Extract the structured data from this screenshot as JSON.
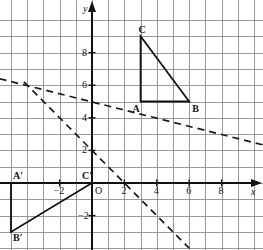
{
  "figure": {
    "kind": "coordinate-plane-geometry-diagram",
    "background_color": "#ffffff",
    "grid_color": "#6b6b6b",
    "axis_color": "#111111",
    "shape_color": "#101010",
    "dashed_color": "#1a1a1a"
  },
  "axes": {
    "x_axis_label": "x",
    "y_axis_label": "y",
    "origin_label": "O",
    "x_ticks": [
      {
        "value": -2,
        "label": "−2"
      },
      {
        "value": 2,
        "label": "2"
      },
      {
        "value": 4,
        "label": "4"
      },
      {
        "value": 6,
        "label": "6"
      },
      {
        "value": 8,
        "label": "8"
      }
    ],
    "y_ticks": [
      {
        "value": -2,
        "label": "−2"
      },
      {
        "value": 2,
        "label": "2"
      },
      {
        "value": 4,
        "label": "4"
      },
      {
        "value": 6,
        "label": "6"
      },
      {
        "value": 8,
        "label": "8"
      }
    ],
    "x_range": [
      -5.7,
      10.7
    ],
    "y_range": [
      -4.0,
      10.4
    ],
    "grid_step": 1
  },
  "chart_data": {
    "type": "scatter",
    "title": "",
    "xlabel": "x",
    "ylabel": "y",
    "xlim": [
      -5.7,
      10.7
    ],
    "ylim": [
      -4.0,
      10.4
    ],
    "grid": true,
    "shapes": [
      {
        "name": "triangle-ABC",
        "style": "solid",
        "vertices": [
          {
            "label": "A",
            "x": 3,
            "y": 5,
            "label_pos": "below-left"
          },
          {
            "label": "B",
            "x": 6,
            "y": 5,
            "label_pos": "below-right"
          },
          {
            "label": "C",
            "x": 3,
            "y": 9,
            "label_pos": "above-left"
          }
        ]
      },
      {
        "name": "triangle-A-prime-B-prime-C-prime",
        "style": "solid",
        "vertices": [
          {
            "label": "A′",
            "x": -5,
            "y": 0,
            "label_pos": "above-right"
          },
          {
            "label": "B′",
            "x": -5,
            "y": -3,
            "label_pos": "below-right"
          },
          {
            "label": "C′",
            "x": 0,
            "y": 0,
            "label_pos": "above-left"
          }
        ]
      }
    ],
    "lines": [
      {
        "name": "shallow-dashed-line",
        "style": "dashed",
        "through": [
          {
            "x": -5.7,
            "y": 6.4
          },
          {
            "x": 10.7,
            "y": 2.3
          }
        ],
        "slope": -0.25,
        "y_intercept": 5.0
      },
      {
        "name": "steep-dashed-line",
        "style": "dashed",
        "through": [
          {
            "x": -4.2,
            "y": 6.2
          },
          {
            "x": 6.0,
            "y": -4.0
          }
        ],
        "slope": -1.0,
        "y_intercept": 2.0
      }
    ]
  },
  "labels": {
    "A": "A",
    "B": "B",
    "C": "C",
    "A_prime": "A′",
    "B_prime": "B′",
    "C_prime": "C′",
    "origin": "O",
    "x": "x",
    "y": "y",
    "neg_two_x": "−2",
    "neg_two_y": "−2",
    "two_x": "2",
    "four_x": "4",
    "six_x": "6",
    "eight_x": "8",
    "two_y": "2",
    "four_y": "4",
    "six_y": "6",
    "eight_y": "8"
  }
}
